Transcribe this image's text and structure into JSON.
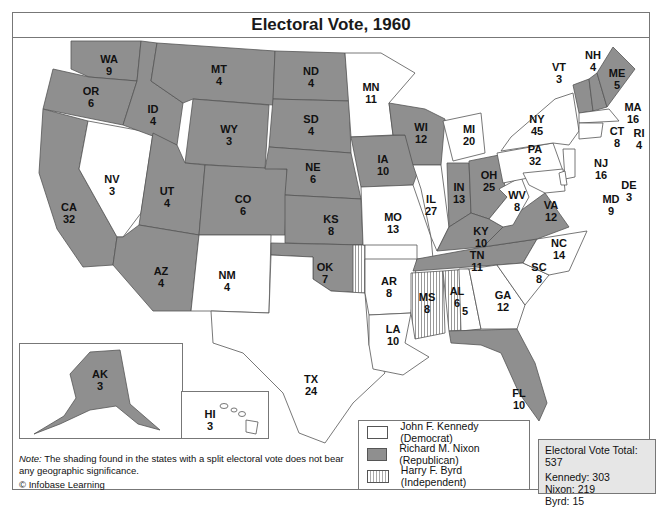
{
  "title": "Electoral Vote, 1960",
  "colors": {
    "democrat": "#ffffff",
    "republican": "#8f8f8f",
    "independent": "striped",
    "border": "#555555"
  },
  "states": [
    {
      "abbr": "WA",
      "votes": "9",
      "party": "R"
    },
    {
      "abbr": "OR",
      "votes": "6",
      "party": "R"
    },
    {
      "abbr": "CA",
      "votes": "32",
      "party": "R"
    },
    {
      "abbr": "NV",
      "votes": "3",
      "party": "D"
    },
    {
      "abbr": "ID",
      "votes": "4",
      "party": "R"
    },
    {
      "abbr": "MT",
      "votes": "4",
      "party": "R"
    },
    {
      "abbr": "WY",
      "votes": "3",
      "party": "R"
    },
    {
      "abbr": "UT",
      "votes": "4",
      "party": "R"
    },
    {
      "abbr": "CO",
      "votes": "6",
      "party": "R"
    },
    {
      "abbr": "AZ",
      "votes": "4",
      "party": "R"
    },
    {
      "abbr": "NM",
      "votes": "4",
      "party": "D"
    },
    {
      "abbr": "ND",
      "votes": "4",
      "party": "R"
    },
    {
      "abbr": "SD",
      "votes": "4",
      "party": "R"
    },
    {
      "abbr": "NE",
      "votes": "6",
      "party": "R"
    },
    {
      "abbr": "KS",
      "votes": "8",
      "party": "R"
    },
    {
      "abbr": "OK",
      "votes": "7",
      "party": "R",
      "split": "1"
    },
    {
      "abbr": "TX",
      "votes": "24",
      "party": "D"
    },
    {
      "abbr": "MN",
      "votes": "11",
      "party": "D"
    },
    {
      "abbr": "IA",
      "votes": "10",
      "party": "R"
    },
    {
      "abbr": "MO",
      "votes": "13",
      "party": "D"
    },
    {
      "abbr": "AR",
      "votes": "8",
      "party": "D"
    },
    {
      "abbr": "LA",
      "votes": "10",
      "party": "D"
    },
    {
      "abbr": "WI",
      "votes": "12",
      "party": "R"
    },
    {
      "abbr": "IL",
      "votes": "27",
      "party": "D"
    },
    {
      "abbr": "MI",
      "votes": "20",
      "party": "D"
    },
    {
      "abbr": "IN",
      "votes": "13",
      "party": "R"
    },
    {
      "abbr": "OH",
      "votes": "25",
      "party": "R"
    },
    {
      "abbr": "KY",
      "votes": "10",
      "party": "R"
    },
    {
      "abbr": "TN",
      "votes": "11",
      "party": "R"
    },
    {
      "abbr": "MS",
      "votes": "8",
      "party": "I"
    },
    {
      "abbr": "AL",
      "votes": "6",
      "party": "I",
      "split": "5"
    },
    {
      "abbr": "GA",
      "votes": "12",
      "party": "D"
    },
    {
      "abbr": "FL",
      "votes": "10",
      "party": "R"
    },
    {
      "abbr": "SC",
      "votes": "8",
      "party": "D"
    },
    {
      "abbr": "NC",
      "votes": "14",
      "party": "D"
    },
    {
      "abbr": "VA",
      "votes": "12",
      "party": "R"
    },
    {
      "abbr": "WV",
      "votes": "8",
      "party": "D"
    },
    {
      "abbr": "PA",
      "votes": "32",
      "party": "D"
    },
    {
      "abbr": "NY",
      "votes": "45",
      "party": "D"
    },
    {
      "abbr": "VT",
      "votes": "3",
      "party": "R"
    },
    {
      "abbr": "NH",
      "votes": "4",
      "party": "R"
    },
    {
      "abbr": "ME",
      "votes": "5",
      "party": "R"
    },
    {
      "abbr": "MA",
      "votes": "16",
      "party": "D"
    },
    {
      "abbr": "RI",
      "votes": "4",
      "party": "D"
    },
    {
      "abbr": "CT",
      "votes": "8",
      "party": "D"
    },
    {
      "abbr": "NJ",
      "votes": "16",
      "party": "D"
    },
    {
      "abbr": "DE",
      "votes": "3",
      "party": "D"
    },
    {
      "abbr": "MD",
      "votes": "9",
      "party": "D"
    },
    {
      "abbr": "AK",
      "votes": "3",
      "party": "R"
    },
    {
      "abbr": "HI",
      "votes": "3",
      "party": "D"
    }
  ],
  "legend": {
    "items": [
      {
        "label": "John F. Kennedy (Democrat)",
        "swatch": "white"
      },
      {
        "label": "Richard M. Nixon (Republican)",
        "swatch": "gray"
      },
      {
        "label": "Harry F. Byrd (Independent)",
        "swatch": "striped"
      }
    ]
  },
  "totals": {
    "header": "Electoral Vote Total: 537",
    "kennedy": "Kennedy: 303",
    "nixon": "Nixon: 219",
    "byrd": "Byrd: 15"
  },
  "note": {
    "label": "Note:",
    "text": " The shading found in the states with a split electoral vote does not bear any geographic significance."
  },
  "credit": "© Infobase Learning"
}
